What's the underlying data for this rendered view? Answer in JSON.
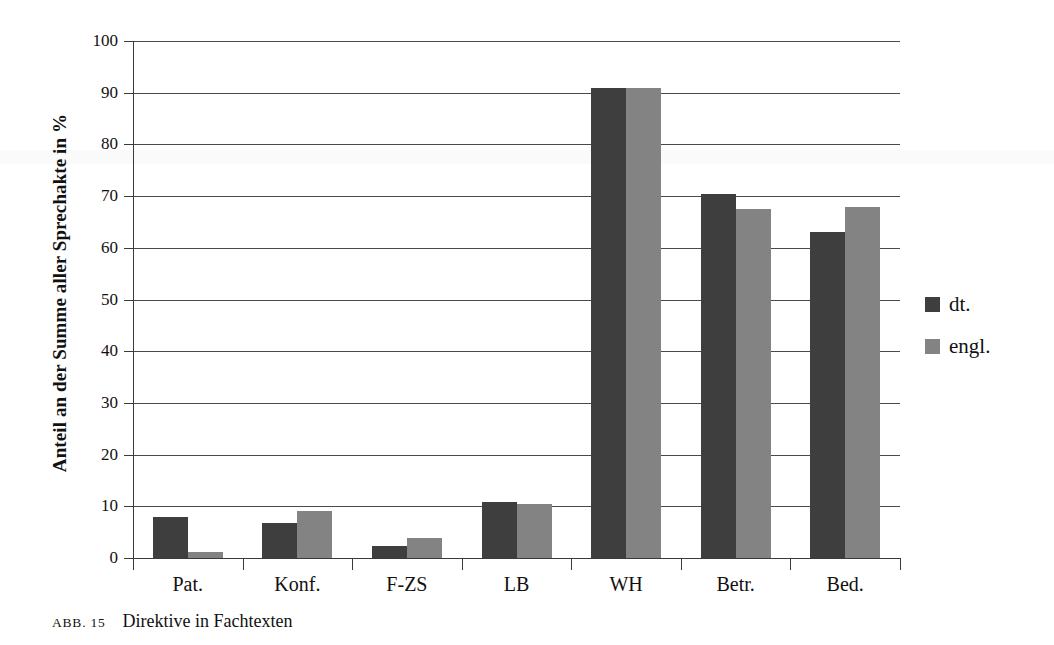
{
  "chart_data": {
    "type": "bar",
    "title": "Direktive in Fachtexten",
    "xlabel": "",
    "ylabel": "Anteil an der Summe aller Sprechakte in %",
    "ylim": [
      0,
      100
    ],
    "yticks": [
      0,
      10,
      20,
      30,
      40,
      50,
      60,
      70,
      80,
      90,
      100
    ],
    "ytick_labels": [
      "0",
      "10",
      "20",
      "30",
      "40",
      "50",
      "60",
      "70",
      "80",
      "90",
      "100"
    ],
    "grid": true,
    "legend_position": "right",
    "categories": [
      "Pat.",
      "Konf.",
      "F-ZS",
      "LB",
      "WH",
      "Betr.",
      "Bed."
    ],
    "series": [
      {
        "name": "dt.",
        "color": "#3f3e3e",
        "values": [
          8.0,
          6.7,
          2.3,
          10.8,
          90.9,
          70.5,
          63.1
        ]
      },
      {
        "name": "engl.",
        "color": "#838383",
        "values": [
          1.2,
          9.0,
          3.8,
          10.4,
          90.9,
          67.6,
          67.9
        ]
      }
    ]
  },
  "caption": {
    "tag": "ABB. 15",
    "text": "Direktive in Fachtexten"
  }
}
